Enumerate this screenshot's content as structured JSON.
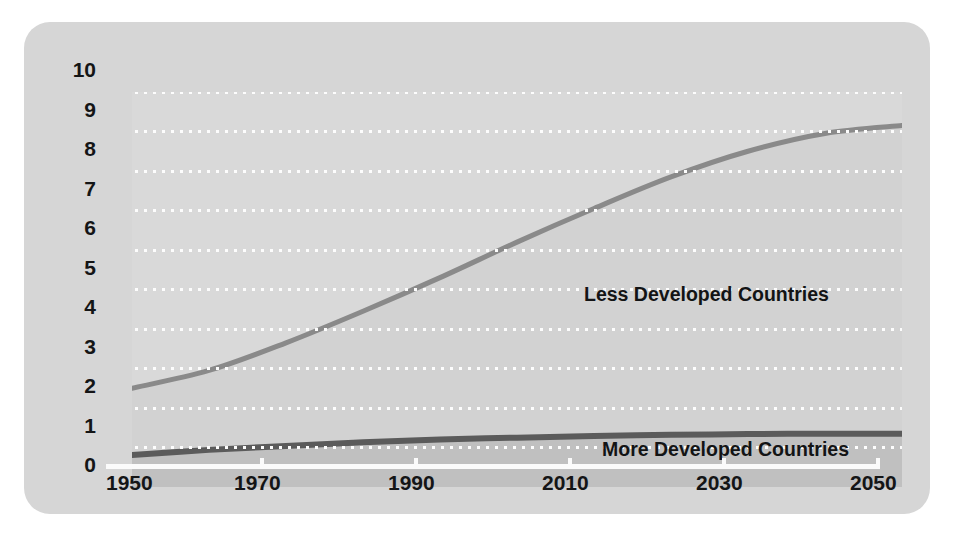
{
  "chart_data": {
    "type": "area",
    "title": "",
    "subtitle": "",
    "xlabel": "",
    "ylabel": "",
    "xlim": [
      1950,
      2050
    ],
    "ylim": [
      0,
      10
    ],
    "grid": true,
    "grid_style": "dotted-horizontal-white",
    "legend_position": "inline-annotation",
    "stacked": true,
    "x": [
      1950,
      1960,
      1970,
      1980,
      1990,
      2000,
      2010,
      2020,
      2030,
      2040,
      2050
    ],
    "x_ticks": [
      "1950",
      "1970",
      "1990",
      "2010",
      "2030",
      "2050"
    ],
    "y_ticks": [
      "0",
      "1",
      "2",
      "3",
      "4",
      "5",
      "6",
      "7",
      "8",
      "9",
      "10"
    ],
    "series": [
      {
        "name": "Less Developed Countries",
        "values": [
          2.5,
          2.95,
          3.65,
          4.45,
          5.3,
          6.2,
          7.05,
          7.85,
          8.5,
          8.95,
          9.15
        ],
        "line_color": "#8a8a8a",
        "fill_color": "#d2d2d2"
      },
      {
        "name": "More Developed Countries",
        "values": [
          0.81,
          0.94,
          1.04,
          1.13,
          1.2,
          1.25,
          1.29,
          1.32,
          1.34,
          1.35,
          1.35
        ],
        "line_color": "#5b5b5b",
        "fill_color": "#c0c0c0"
      }
    ]
  },
  "colors": {
    "card_background": "#d6d6d6",
    "plot_background": "#d9d9d9",
    "gridline": "#fdfdfd",
    "baseline": "#fbfbfb",
    "text": "#141516",
    "upper_line": "#8a8a8a",
    "lower_line": "#5b5b5b",
    "upper_fill": "#d2d2d2",
    "lower_fill": "#c0c0c0"
  },
  "axis": {
    "y_labels": [
      "10",
      "9",
      "8",
      "7",
      "6",
      "5",
      "4",
      "3",
      "2",
      "1",
      "0"
    ],
    "x_labels": [
      "1950",
      "1970",
      "1990",
      "2010",
      "2030",
      "2050"
    ]
  },
  "annotations": {
    "upper": "Less Developed Countries",
    "lower": "More Developed Countries"
  }
}
